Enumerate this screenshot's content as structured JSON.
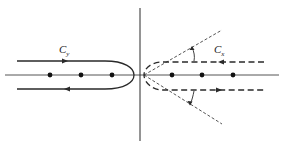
{
  "diagram": {
    "type": "contour-integration",
    "labels": {
      "left_contour": "C",
      "left_contour_sub": "y",
      "right_contour": "C",
      "right_contour_sub": "x"
    },
    "axes": {
      "vertical_x": 140,
      "horizontal_y": 75
    },
    "left_poles_x": [
      50,
      81,
      112
    ],
    "right_poles_x": [
      172,
      202,
      233
    ],
    "colors": {
      "stroke": "#2a2a2a",
      "background": "#ffffff"
    }
  }
}
